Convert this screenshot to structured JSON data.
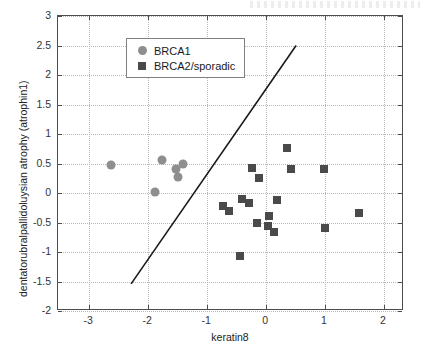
{
  "chart_data": {
    "type": "scatter",
    "title": "",
    "xlabel": "keratin8",
    "ylabel": "dentatorubralpallidoluysian atrophy (atrophin1)",
    "xlim": [
      -3.53,
      2.34
    ],
    "ylim": [
      -2,
      3
    ],
    "xticks": [
      -3,
      -2,
      -1,
      0,
      1,
      2
    ],
    "yticks": [
      -2,
      -1.5,
      -1,
      -0.5,
      0,
      0.5,
      1,
      1.5,
      2,
      2.5,
      3
    ],
    "xticklabels": [
      "-3",
      "-2",
      "-1",
      "0",
      "1",
      "2"
    ],
    "yticklabels": [
      "-2",
      "-1.5",
      "-1",
      "-0.5",
      "0",
      "0.5",
      "1",
      "1.5",
      "2",
      "2.5",
      "3"
    ],
    "grid": true,
    "legend_position": "upper left",
    "series": [
      {
        "name": "BRCA1",
        "marker": "circle",
        "color": "#8e8e8e",
        "points": [
          {
            "x": -2.63,
            "y": 0.47
          },
          {
            "x": -1.76,
            "y": 0.56
          },
          {
            "x": -1.53,
            "y": 0.41
          },
          {
            "x": -1.49,
            "y": 0.27
          },
          {
            "x": -1.41,
            "y": 0.5
          },
          {
            "x": -1.88,
            "y": 0.02
          },
          {
            "x": -0.56,
            "y": 2.18
          }
        ]
      },
      {
        "name": "BRCA2/sporadic",
        "marker": "square",
        "color": "#4a4a4a",
        "points": [
          {
            "x": -0.73,
            "y": -0.22
          },
          {
            "x": -0.63,
            "y": -0.3
          },
          {
            "x": -0.41,
            "y": -0.1
          },
          {
            "x": -0.29,
            "y": -0.17
          },
          {
            "x": -0.24,
            "y": 0.42
          },
          {
            "x": -0.15,
            "y": -0.51
          },
          {
            "x": -0.12,
            "y": 0.25
          },
          {
            "x": 0.03,
            "y": -0.56
          },
          {
            "x": 0.05,
            "y": -0.39
          },
          {
            "x": 0.14,
            "y": -0.66
          },
          {
            "x": 0.19,
            "y": -0.12
          },
          {
            "x": 0.36,
            "y": 0.77
          },
          {
            "x": 0.42,
            "y": 0.4
          },
          {
            "x": 0.98,
            "y": 0.41
          },
          {
            "x": 1.0,
            "y": -0.59
          },
          {
            "x": 1.58,
            "y": -0.34
          },
          {
            "x": -0.44,
            "y": -1.07
          }
        ]
      }
    ],
    "annotations": [
      {
        "type": "line",
        "name": "decision-boundary",
        "x1": -2.29,
        "y1": -1.54,
        "x2": 0.51,
        "y2": 2.5,
        "color": "#1a1a1a"
      }
    ]
  },
  "legend": {
    "items": [
      {
        "label": "BRCA1",
        "marker": "circle-marker-icon"
      },
      {
        "label": "BRCA2/sporadic",
        "marker": "square-marker-icon"
      }
    ]
  }
}
